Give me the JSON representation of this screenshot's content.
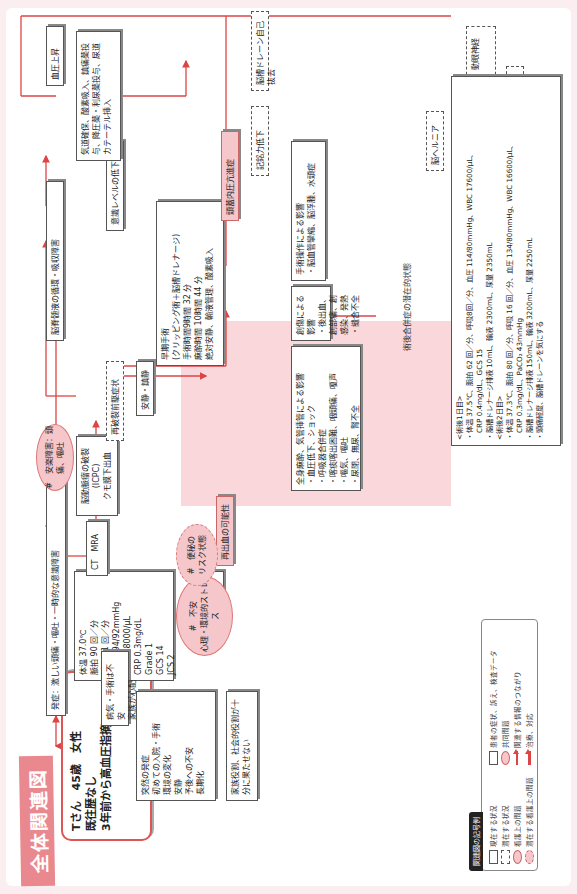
{
  "title": "全体関連図",
  "patient": {
    "lines": "Tさん　45歳　女性\n既往歴なし\n3年前から高血圧指摘"
  },
  "nodes": {
    "onset": "発症：激しい頭痛・嘔吐・一時的な意識障害",
    "vitals": "体温 37.0℃\n脈拍 90 回／分\n呼吸 11 回／分\n血圧 194/92mmHg\nWBC 18000/μL\nCRP 0.3mg/dL\nGrade 1\nGCS 14\nJCS 2",
    "ct_mra": "CT　MRA",
    "aneurysm": "脳動脈瘤の破裂\n(ICPC)\nクモ膜下出血",
    "rebleed_sign": "再破裂前駆症状",
    "rest": "安静・鎮静",
    "surgery": "早期手術\n(クリッピング術＋脳槽ドレナージ)\n手術時間9時間 32 分\n麻酔時間 10時間 44 分\n絶対安静、輸液管理、酸素吸入",
    "airway": "脳脊髄液の循環・吸収障害",
    "consciousness": "意識レベルの低下",
    "icp": "頭蓋内圧亢進症",
    "memory": "記銘力低下",
    "drain_removal": "脳槽ドレーン自己抜去",
    "herniation": "脳ヘルニア",
    "compression": "中脳圧迫、延髄圧迫、動眼神経圧迫、大脳動脈狭窄",
    "life_threat": "生命の危機的状態",
    "bp_up_top": "血圧上昇",
    "treatment": "気道確保、酸素吸入、鎮痛薬投与、降圧薬・利尿薬投与、尿道カテーテル挿入",
    "stress_box": "突然の発症\n初めての入院・手術\n環境の変化\n安静\n予後への不安\n長期化",
    "family": "家族役割、社会的役割が十分に果たせない",
    "anxiety_note": "病気・手術は不安\n家族が心配",
    "bp_up_mid": "血圧上昇",
    "rebleed": "再出血の可能性",
    "surgical_effect": "手術操作による影響\n・脳血管攣縮、脳浮腫、水頭症",
    "wound_effect": "創傷による影響\n・後出血、創部痛、創感染、発熱\n・縫合不全",
    "anesthesia_effect": "全身麻酔、気管挿管による影響\n・血圧低下、ショック\n・呼吸器合併症\n・喀痰喀出困難、咽頭痛、嗄声\n・嘔気、嘔吐\n・尿閉、無尿、腎不全"
  },
  "problems": {
    "pain": "#　安楽障害：頭痛、嘔吐",
    "anxiety": "#　不安\n心理・環境的ストレス",
    "constipation": "#　便秘の\nリスク状態"
  },
  "zone": {
    "label": "術後合併症の潜在的状態"
  },
  "postop_note": "<術後1日目>\n・体温 37.5℃、脈拍 62 回／分、呼吸8回／分、血圧 114/80mmHg、WBC 17600/μL、\n　CRP 0.4mg/dL、GCS 15\n・脳槽ドレナージ排液 10mL、輸液 2300mL、尿量 2350mL\n<術後2日目>\n・体温 37.3℃、脈拍 80 回／分、呼吸 16 回／分、血圧 134/80mmHg、WBC 16600/μL、\n　CRP 0.3mg/dL、PaCO₂ 43mmHg\n・脳槽ドレナージ排液 150mL、輸液 3200mL、尿量 2250mL\n・頭痛軽度、脳槽ドレーンを気にする",
  "legend": {
    "title": "関連図の記号例",
    "items": [
      "現在する状況",
      "潜在する状況",
      "看護上の問題",
      "潜在する看護上の問題",
      "患者の症状、訴え、検査データ",
      "共同問題",
      "関連する情報のつながり",
      "治療、対応"
    ]
  },
  "colors": {
    "accent": "#e9898f",
    "line": "#d44444",
    "problem_fill": "#f5c6ca",
    "zone": "#f9d7da"
  }
}
